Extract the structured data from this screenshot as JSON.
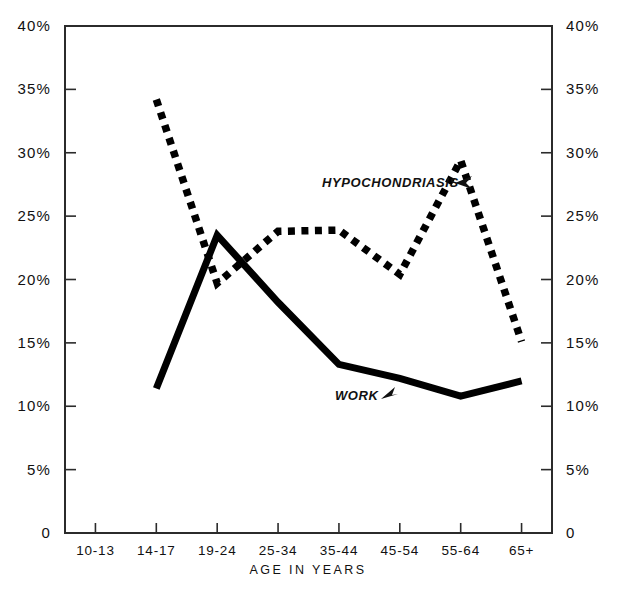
{
  "chart_data": {
    "type": "line",
    "title": "",
    "subtitle": "",
    "xlabel": "AGE IN YEARS",
    "ylabel": "",
    "ylim": [
      0,
      40
    ],
    "grid": false,
    "legend_position": "inline-annotation",
    "categories": [
      "10-13",
      "14-17",
      "19-24",
      "25-34",
      "35-44",
      "45-54",
      "55-64",
      "65+"
    ],
    "ytick_labels": [
      "0",
      "5%",
      "10%",
      "15%",
      "20%",
      "25%",
      "30%",
      "35%",
      "40%"
    ],
    "ytick_values": [
      0,
      5,
      10,
      15,
      20,
      25,
      30,
      35,
      40
    ],
    "right_axis_tick_labels": [
      "0",
      "5%",
      "10%",
      "15%",
      "20%",
      "25%",
      "30%",
      "35%",
      "40%"
    ],
    "series": [
      {
        "name": "HYPOCHONDRIASIS",
        "style": "dotted",
        "color": "#000000",
        "x": [
          "14-17",
          "19-24",
          "25-34",
          "35-44",
          "45-54",
          "55-64",
          "65+"
        ],
        "values": [
          34.2,
          19.7,
          23.8,
          23.9,
          20.4,
          29.4,
          15.1
        ]
      },
      {
        "name": "WORK",
        "style": "solid",
        "color": "#000000",
        "x": [
          "14-17",
          "19-24",
          "25-34",
          "35-44",
          "45-54",
          "55-64",
          "65+"
        ],
        "values": [
          11.4,
          23.5,
          18.2,
          13.3,
          12.2,
          10.8,
          12.0
        ]
      }
    ],
    "annotations": [
      {
        "text": "HYPOCHONDRIASIS",
        "target_series": "HYPOCHONDRIASIS",
        "arrow": "right"
      },
      {
        "text": "WORK",
        "target_series": "WORK",
        "arrow": "up-right"
      }
    ]
  },
  "axes": {
    "left_axis_name": "percent-left",
    "right_axis_name": "percent-right",
    "bottom_axis_name": "age-groups"
  }
}
